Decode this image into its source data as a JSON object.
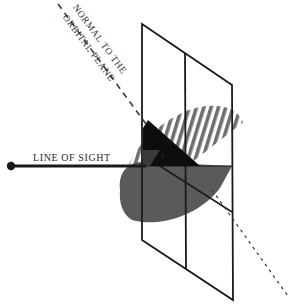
{
  "diagram": {
    "labels": {
      "normal_line1": "NORMAL TO THE",
      "normal_line2": "ORBITAL PLANE",
      "line_of_sight": "LINE OF SIGHT",
      "inclination": "i"
    },
    "colors": {
      "background": "#ffffff",
      "frame": "#1a1a1a",
      "orbit_near": "#5a5a5a",
      "orbit_far_hatch": "#6e6e6e",
      "inclination_wedge": "#0d0d0d",
      "text": "#2a2a2a"
    }
  }
}
